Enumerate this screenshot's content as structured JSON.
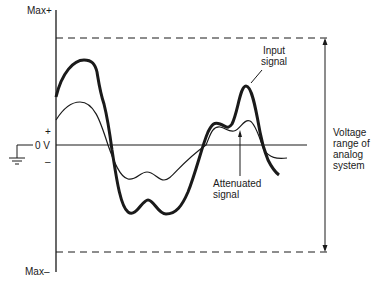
{
  "diagram": {
    "type": "analog-signal-attenuation",
    "axis_labels": {
      "max_plus": "Max+",
      "max_minus": "Max–",
      "plus": "+",
      "minus": "–",
      "zero": "0 V"
    },
    "annotations": {
      "input_signal": [
        "Input",
        "signal"
      ],
      "attenuated_signal": [
        "Attenuated",
        "signal"
      ],
      "voltage_range": [
        "Voltage",
        "range of",
        "analog",
        "system"
      ]
    },
    "icons": {
      "ground": "ground-symbol"
    },
    "colors": {
      "ink": "#1a1a1a",
      "background": "#ffffff"
    }
  }
}
